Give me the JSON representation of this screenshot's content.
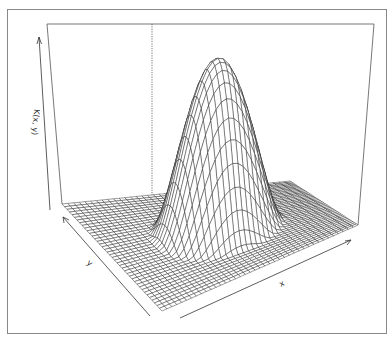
{
  "chart_data": {
    "type": "surface3d",
    "title": "",
    "function_description": "Bell/dome-shaped kernel surface K(x, y), peaked at the center of the domain and flat (zero) near the edges",
    "xlabel": "x",
    "ylabel": "y",
    "zlabel": "K(x, y)",
    "ticks": "none (arrow-style axes, no tick labels)",
    "grid_resolution": 40,
    "peak": {
      "x": 0.5,
      "y": 0.5,
      "z": 1.0
    },
    "support_fraction": 0.6,
    "box": true,
    "perspective": true,
    "colors": {
      "wire": "#222222",
      "box": "#555555",
      "frame": "#888888",
      "background": "#ffffff"
    }
  },
  "labels": {
    "z_axis": "K(x, y)",
    "y_axis": "y",
    "x_axis": "x"
  }
}
